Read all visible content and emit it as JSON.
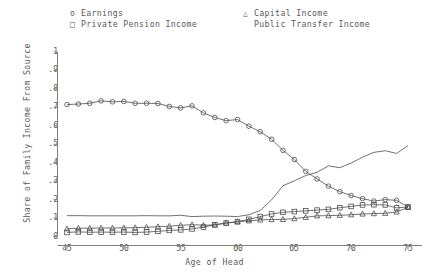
{
  "legend": {
    "entries": [
      {
        "label": "Earnings",
        "marker": "circle",
        "column": 1,
        "row": 1
      },
      {
        "label": "Private Pension Income",
        "marker": "square",
        "column": 1,
        "row": 2
      },
      {
        "label": "Capital Income",
        "marker": "triangle",
        "column": 2,
        "row": 1
      },
      {
        "label": "Public Transfer Income",
        "marker": "none",
        "column": 2,
        "row": 2
      }
    ]
  },
  "axes": {
    "xlabel": "Age of Head",
    "ylabel": "Share of Family Income From Source",
    "xticks": [
      "45",
      "50",
      "55",
      "60",
      "65",
      "70",
      "75"
    ],
    "yticks": [
      "0",
      ".1",
      ".2",
      ".3",
      ".4",
      ".5",
      ".6",
      ".7",
      ".8",
      ".9",
      "1"
    ]
  },
  "chart_data": {
    "type": "line",
    "title": "",
    "xlabel": "Age of Head",
    "ylabel": "Share of Family Income From Source",
    "xlim": [
      45,
      75
    ],
    "ylim": [
      0,
      1
    ],
    "grid": false,
    "legend_position": "above-plot",
    "x": [
      45,
      46,
      47,
      48,
      49,
      50,
      51,
      52,
      53,
      54,
      55,
      56,
      57,
      58,
      59,
      60,
      61,
      62,
      63,
      64,
      65,
      66,
      67,
      68,
      69,
      70,
      71,
      72,
      73,
      74,
      75
    ],
    "series": [
      {
        "name": "Earnings",
        "marker": "circle",
        "values": [
          0.715,
          0.718,
          0.722,
          0.735,
          0.73,
          0.732,
          0.722,
          0.722,
          0.721,
          0.705,
          0.697,
          0.708,
          0.67,
          0.645,
          0.628,
          0.634,
          0.598,
          0.568,
          0.527,
          0.467,
          0.417,
          0.353,
          0.312,
          0.273,
          0.243,
          0.222,
          0.205,
          0.192,
          0.2,
          0.196,
          0.16
        ]
      },
      {
        "name": "Private Pension Income",
        "marker": "square",
        "values": [
          0.022,
          0.025,
          0.023,
          0.024,
          0.023,
          0.024,
          0.022,
          0.024,
          0.028,
          0.033,
          0.036,
          0.041,
          0.051,
          0.063,
          0.073,
          0.081,
          0.093,
          0.108,
          0.122,
          0.131,
          0.135,
          0.139,
          0.143,
          0.147,
          0.156,
          0.163,
          0.171,
          0.172,
          0.171,
          0.155,
          0.16
        ]
      },
      {
        "name": "Capital Income",
        "marker": "triangle",
        "values": [
          0.042,
          0.045,
          0.045,
          0.046,
          0.046,
          0.047,
          0.048,
          0.05,
          0.053,
          0.056,
          0.061,
          0.064,
          0.061,
          0.063,
          0.073,
          0.079,
          0.085,
          0.09,
          0.092,
          0.093,
          0.097,
          0.104,
          0.112,
          0.113,
          0.115,
          0.118,
          0.122,
          0.124,
          0.126,
          0.133,
          0.158
        ]
      },
      {
        "name": "Public Transfer Income",
        "marker": "none",
        "values": [
          0.113,
          0.113,
          0.112,
          0.112,
          0.112,
          0.112,
          0.112,
          0.113,
          0.112,
          0.112,
          0.115,
          0.108,
          0.11,
          0.111,
          0.11,
          0.108,
          0.118,
          0.141,
          0.199,
          0.275,
          0.302,
          0.33,
          0.348,
          0.383,
          0.373,
          0.398,
          0.43,
          0.456,
          0.465,
          0.45,
          0.493
        ]
      }
    ]
  }
}
